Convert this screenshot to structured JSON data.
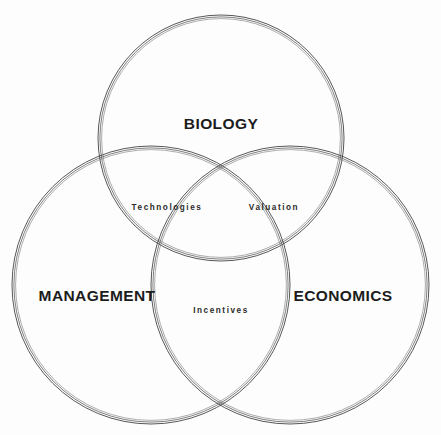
{
  "diagram": {
    "type": "venn-3-circle",
    "title_visible": false,
    "background_color": "#fdfdfd",
    "stroke_color": "#3a3a3a",
    "text_color": "#1c1c1c",
    "sets": [
      {
        "id": "biology",
        "label": "BIOLOGY",
        "label_x": 221,
        "label_y": 124,
        "cx": 221,
        "cy": 138,
        "r": 123
      },
      {
        "id": "management",
        "label": "MANAGEMENT",
        "label_x": 97,
        "label_y": 296,
        "cx": 151,
        "cy": 285,
        "r": 139
      },
      {
        "id": "economics",
        "label": "ECONOMICS",
        "label_x": 343,
        "label_y": 296,
        "cx": 290,
        "cy": 285,
        "r": 139
      }
    ],
    "intersections": [
      {
        "id": "technologies",
        "label": "Technologies",
        "sets": "biology-management",
        "label_x": 167,
        "label_y": 207
      },
      {
        "id": "valuation",
        "label": "Valuation",
        "sets": "biology-economics",
        "label_x": 274,
        "label_y": 207
      },
      {
        "id": "incentives",
        "label": "Incentives",
        "sets": "management-economics",
        "label_x": 221,
        "label_y": 310
      }
    ]
  }
}
